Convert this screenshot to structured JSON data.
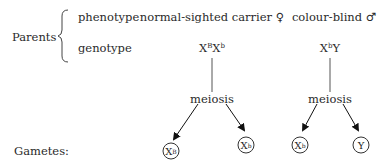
{
  "labels": {
    "parents": "Parents",
    "phenotype": "phenotype",
    "genotype": "genotype",
    "gametes": "Gametes:"
  },
  "mother": {
    "phenotype": "normal-sighted carrier",
    "sex_symbol": "♀",
    "genotype": [
      {
        "base": "X",
        "sup": "B"
      },
      {
        "base": "X",
        "sup": "b"
      }
    ],
    "process": "meiosis",
    "gametes": [
      {
        "base": "X",
        "sup": "B"
      },
      {
        "base": "X",
        "sup": "b"
      }
    ]
  },
  "father": {
    "phenotype": "colour-blind",
    "sex_symbol": "♂",
    "genotype": [
      {
        "base": "X",
        "sup": "b"
      },
      {
        "base": "Y",
        "sup": ""
      }
    ],
    "process": "meiosis",
    "gametes": [
      {
        "base": "X",
        "sup": "b"
      },
      {
        "base": "Y",
        "sup": ""
      }
    ]
  }
}
